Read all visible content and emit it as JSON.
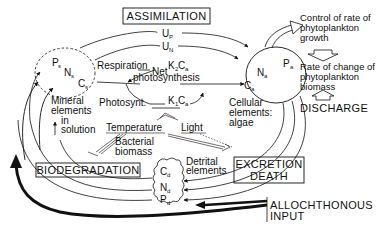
{
  "processes": {
    "assimilation": "ASSIMILATION",
    "biodegradation": "BIODEGRADATION",
    "excretion_death": [
      "EXCRETION",
      "DEATH"
    ],
    "discharge": "DISCHARGE",
    "allochthonous_input": [
      "ALLOCHTHONOUS",
      "INPUT"
    ]
  },
  "pools": {
    "soluble": {
      "symbols": [
        "P",
        "N",
        "C"
      ],
      "subscript": "s"
    },
    "algal": {
      "symbols": [
        "P",
        "N",
        "C"
      ],
      "subscript": "a"
    },
    "detrital": {
      "symbols": [
        "C",
        "N",
        "P"
      ],
      "subscript": "d"
    }
  },
  "uptake": {
    "phosphorus": {
      "U": "U",
      "sub": "P"
    },
    "nitrogen": {
      "U": "U",
      "sub": "N"
    }
  },
  "labels": {
    "respiration": "Respiration",
    "net": "Net",
    "photosynthesis": "photosynthesis",
    "photosynt": "Photosynt.",
    "k2ca": {
      "K": "K",
      "ksub": "2",
      "C": "C",
      "csub": "a"
    },
    "k1ca": {
      "K": "K",
      "ksub": "1",
      "C": "C",
      "csub": "a"
    },
    "temperature": "Temperature",
    "light": "Light",
    "bacterial_biomass": [
      "Bacterial",
      "biomass"
    ],
    "mineral_elements": [
      "Mineral",
      "elements",
      "in",
      "solution"
    ],
    "cellular_elements": [
      "Cellular",
      "elements:",
      "algae"
    ],
    "detrital_elements": [
      "Detrital",
      "elements"
    ],
    "control_rate": [
      "Control of rate of",
      "phytoplankton",
      "growth"
    ],
    "rate_change": [
      "Rate of change of",
      "phytoplankton",
      "biomass"
    ]
  }
}
